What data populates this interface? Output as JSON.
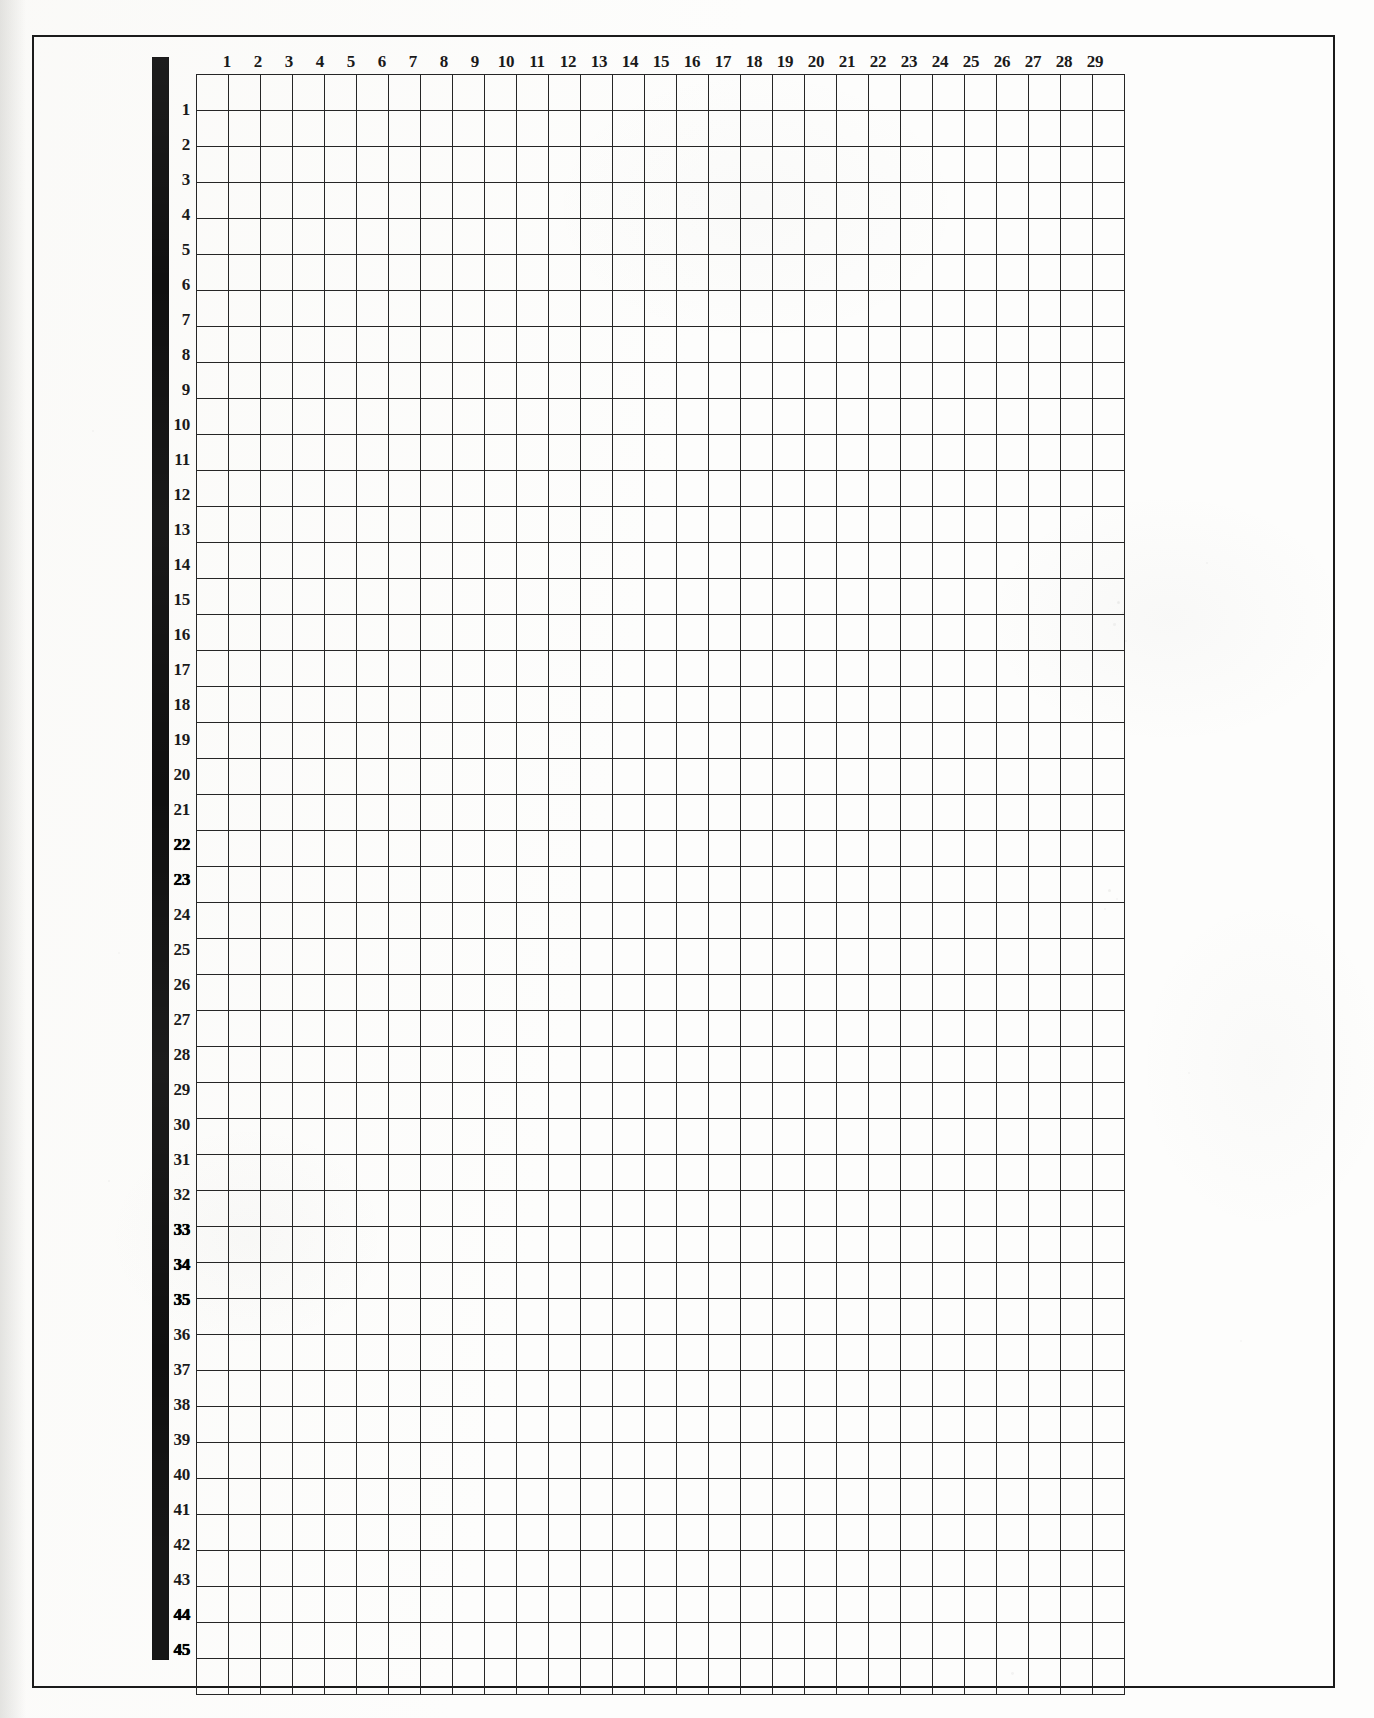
{
  "document": {
    "kind": "scanned-blank-grid-sheet",
    "title": "Blank numbered grid worksheet"
  },
  "grid": {
    "columns": 29,
    "rows": 45,
    "column_labels": [
      "1",
      "2",
      "3",
      "4",
      "5",
      "6",
      "7",
      "8",
      "9",
      "10",
      "11",
      "12",
      "13",
      "14",
      "15",
      "16",
      "17",
      "18",
      "19",
      "20",
      "21",
      "22",
      "23",
      "24",
      "25",
      "26",
      "27",
      "28",
      "29"
    ],
    "row_labels": [
      "1",
      "2",
      "3",
      "4",
      "5",
      "6",
      "7",
      "8",
      "9",
      "10",
      "11",
      "12",
      "13",
      "14",
      "15",
      "16",
      "17",
      "18",
      "19",
      "20",
      "21",
      "22",
      "23",
      "24",
      "25",
      "26",
      "27",
      "28",
      "29",
      "30",
      "31",
      "32",
      "33",
      "34",
      "35",
      "36",
      "37",
      "38",
      "39",
      "40",
      "41",
      "42",
      "43",
      "44",
      "45"
    ],
    "heavy_ink_rows": [
      "22",
      "23",
      "33",
      "34",
      "35",
      "44",
      "45"
    ],
    "cells": [],
    "cell_width_px": 31,
    "cell_height_px": 35
  },
  "colors": {
    "paper": "#fdfdfc",
    "ink": "#1a1a1a",
    "grid_line": "#262626",
    "frame": "#1b1b1b",
    "margin_bar": "#101010"
  },
  "margin_bar": {
    "name": "left-margin-black-bar"
  },
  "speckles": [
    {
      "x": 1117,
      "y": 601,
      "r": 1.6,
      "o": 0.3
    },
    {
      "x": 1122,
      "y": 612,
      "r": 1.1,
      "o": 0.24
    },
    {
      "x": 1113,
      "y": 623,
      "r": 1.3,
      "o": 0.22
    },
    {
      "x": 1125,
      "y": 640,
      "r": 0.9,
      "o": 0.2
    },
    {
      "x": 1108,
      "y": 889,
      "r": 1.5,
      "o": 0.28
    },
    {
      "x": 1116,
      "y": 898,
      "r": 1.0,
      "o": 0.22
    },
    {
      "x": 1104,
      "y": 908,
      "r": 1.2,
      "o": 0.2
    },
    {
      "x": 1206,
      "y": 562,
      "r": 1.0,
      "o": 0.18
    },
    {
      "x": 1188,
      "y": 1072,
      "r": 1.1,
      "o": 0.16
    },
    {
      "x": 1240,
      "y": 1340,
      "r": 0.9,
      "o": 0.15
    },
    {
      "x": 92,
      "y": 430,
      "r": 1.0,
      "o": 0.16
    },
    {
      "x": 108,
      "y": 1180,
      "r": 1.2,
      "o": 0.18
    },
    {
      "x": 1011,
      "y": 1672,
      "r": 1.4,
      "o": 0.22
    },
    {
      "x": 118,
      "y": 952,
      "r": 0.9,
      "o": 0.14
    }
  ]
}
